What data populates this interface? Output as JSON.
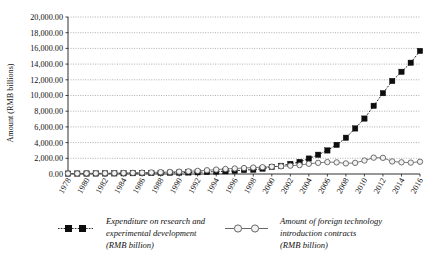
{
  "chart_data": {
    "type": "line",
    "title": "",
    "xlabel": "",
    "ylabel": "Amount (RMB billions)",
    "ylim": [
      0,
      20000
    ],
    "ytick_labels": [
      "20,000.00",
      "18,000.00",
      "16,000.00",
      "14,000.00",
      "12,000.00",
      "10,000.00",
      "8,000.00",
      "6,000.00",
      "4,000.00",
      "2,000.00",
      "0.00"
    ],
    "ytick_values": [
      20000,
      18000,
      16000,
      14000,
      12000,
      10000,
      8000,
      6000,
      4000,
      2000,
      0
    ],
    "xtick_labels": [
      "1978",
      "1980",
      "1982",
      "1984",
      "1986",
      "1988",
      "1990",
      "1992",
      "1994",
      "1996",
      "1998",
      "2000",
      "2002",
      "2004",
      "2006",
      "2008",
      "2010",
      "2012",
      "2014",
      "2016"
    ],
    "x": [
      1978,
      1979,
      1980,
      1981,
      1982,
      1983,
      1984,
      1985,
      1986,
      1987,
      1988,
      1989,
      1990,
      1991,
      1992,
      1993,
      1994,
      1995,
      1996,
      1997,
      1998,
      1999,
      2000,
      2001,
      2002,
      2003,
      2004,
      2005,
      2006,
      2007,
      2008,
      2009,
      2010,
      2011,
      2012,
      2013,
      2014,
      2015,
      2016
    ],
    "grid": true,
    "legend_position": "bottom",
    "series": [
      {
        "name": "Expenditure on research and experimental development (RMB billion)",
        "marker": "filled-square",
        "line_style": "dotted",
        "color": "#0d0d0d",
        "values": [
          50,
          55,
          60,
          65,
          70,
          78,
          88,
          102,
          115,
          130,
          148,
          160,
          175,
          195,
          220,
          260,
          310,
          349,
          404,
          509,
          551,
          679,
          896,
          1042,
          1288,
          1540,
          1966,
          2450,
          3003,
          3710,
          4616,
          5802,
          7063,
          8687,
          10298,
          11847,
          13016,
          14170,
          15677
        ]
      },
      {
        "name": "Amount of foreign technology introduction contracts (RMB billion)",
        "marker": "open-circle",
        "line_style": "solid",
        "color": "#575757",
        "values": [
          60,
          70,
          80,
          90,
          100,
          110,
          125,
          145,
          170,
          200,
          230,
          260,
          300,
          340,
          400,
          480,
          560,
          640,
          700,
          760,
          820,
          870,
          930,
          980,
          1060,
          1130,
          1300,
          1420,
          1520,
          1480,
          1350,
          1420,
          1720,
          2080,
          2060,
          1600,
          1490,
          1450,
          1560
        ]
      }
    ]
  },
  "legend": {
    "entries": [
      {
        "line1": "Expenditure on research and",
        "line2": "experimental development",
        "line3": "(RMB billion)",
        "marker": "filled-square-dotted"
      },
      {
        "line1": "Amount of foreign technology",
        "line2": "introduction contracts",
        "line3": "(RMB billion)",
        "marker": "open-circle-solid"
      }
    ]
  },
  "colors": {
    "series_black": "#0d0d0d",
    "series_gray": "#575757",
    "grid": "#8d8d8d",
    "axis": "#1a1a1a",
    "background": "#ffffff"
  }
}
